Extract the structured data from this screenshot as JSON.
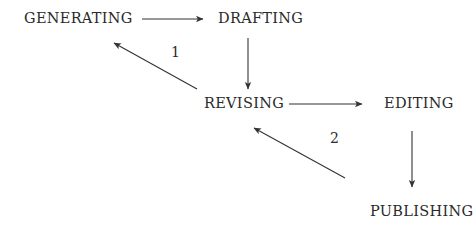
{
  "diagram": {
    "nodes": [
      {
        "id": "generating",
        "label": "GENERATING"
      },
      {
        "id": "drafting",
        "label": "DRAFTING"
      },
      {
        "id": "revising",
        "label": "REVISING"
      },
      {
        "id": "editing",
        "label": "EDITING"
      },
      {
        "id": "publishing",
        "label": "PUBLISHING"
      }
    ],
    "edges": [
      {
        "from": "generating",
        "to": "drafting",
        "label": ""
      },
      {
        "from": "drafting",
        "to": "revising",
        "label": ""
      },
      {
        "from": "revising",
        "to": "generating",
        "label": "1"
      },
      {
        "from": "revising",
        "to": "editing",
        "label": ""
      },
      {
        "from": "editing",
        "to": "publishing",
        "label": ""
      },
      {
        "from": "publishing",
        "to": "revising",
        "label": "2"
      }
    ],
    "edge_labels": {
      "loop1": "1",
      "loop2": "2"
    },
    "colors": {
      "text": "#2a2a2a",
      "line": "#333333",
      "background": "#ffffff"
    }
  }
}
